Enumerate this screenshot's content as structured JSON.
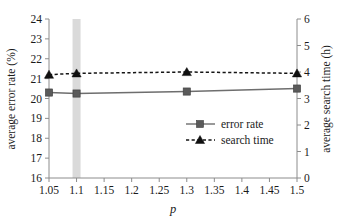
{
  "chart_data": {
    "type": "line",
    "title": "",
    "xlabel": "p",
    "ylabel": "average error rate (%)",
    "y2label": "average search time (h)",
    "x": [
      1.05,
      1.1,
      1.3,
      1.5
    ],
    "xlim": [
      1.05,
      1.5
    ],
    "ylim": [
      16,
      24
    ],
    "y2lim": [
      0,
      6
    ],
    "xticks": [
      "1.05",
      "1.1",
      "1.15",
      "1.2",
      "1.25",
      "1.3",
      "1.35",
      "1.4",
      "1.45",
      "1.5"
    ],
    "xtick_values": [
      1.05,
      1.1,
      1.15,
      1.2,
      1.25,
      1.3,
      1.35,
      1.4,
      1.45,
      1.5
    ],
    "yticks": [
      "16",
      "17",
      "18",
      "19",
      "20",
      "21",
      "22",
      "23",
      "24"
    ],
    "ytick_values": [
      16,
      17,
      18,
      19,
      20,
      21,
      22,
      23,
      24
    ],
    "y2ticks": [
      "0",
      "1",
      "2",
      "3",
      "4",
      "5",
      "6"
    ],
    "y2tick_values": [
      0,
      1,
      2,
      3,
      4,
      5,
      6
    ],
    "grid": false,
    "legend_position": "center-right-inside",
    "series": [
      {
        "name": "error rate",
        "axis": "left",
        "marker": "square",
        "linestyle": "solid",
        "color": "#6e6e6e",
        "values": [
          20.3,
          20.25,
          20.35,
          20.5
        ]
      },
      {
        "name": "search time",
        "axis": "right",
        "marker": "triangle",
        "linestyle": "dashed",
        "color": "#101010",
        "values": [
          3.9,
          3.95,
          4.0,
          3.95
        ]
      }
    ],
    "annotations": [
      {
        "type": "vertical-band",
        "name": "highlight-band-p-1.1",
        "x": 1.1,
        "color": "#d4d4d4"
      }
    ]
  },
  "legend": {
    "items": [
      {
        "label": "error rate"
      },
      {
        "label": "search time"
      }
    ]
  },
  "axes": {
    "x_label": "p",
    "y_left_label": "average error rate (%)",
    "y_right_label": "average search time (h)"
  }
}
